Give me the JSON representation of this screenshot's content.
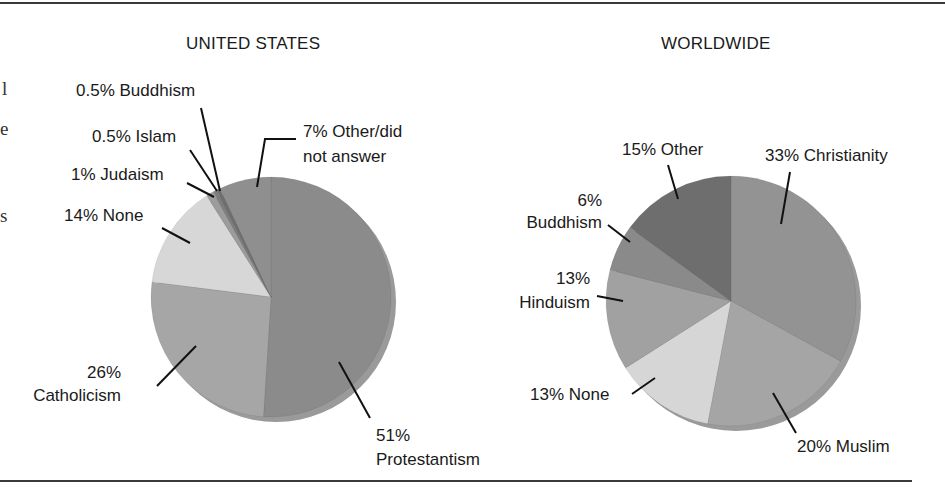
{
  "margin_text": {
    "letters": [
      {
        "char": "l",
        "x": 2,
        "y": 55
      },
      {
        "char": "e",
        "x": 0,
        "y": 117
      },
      {
        "char": "s",
        "x": 0,
        "y": 203
      }
    ]
  },
  "colors": {
    "rule": "#3a3a3a",
    "leader": "#111111",
    "rim": "#9a9a9a"
  },
  "chart_data": [
    {
      "type": "pie",
      "title": "UNITED STATES",
      "center": [
        271,
        297
      ],
      "radius": 120,
      "start_angle_deg": 0,
      "direction": "clockwise",
      "slices": [
        {
          "name": "Protestantism",
          "value": 51,
          "label": "51%\nProtestantism",
          "color": "#8b8b8b"
        },
        {
          "name": "Catholicism",
          "value": 26,
          "label": "26%\nCatholicism",
          "color": "#a6a6a6"
        },
        {
          "name": "None",
          "value": 14,
          "label": "14% None",
          "color": "#d7d7d7"
        },
        {
          "name": "Judaism",
          "value": 1,
          "label": "1% Judaism",
          "color": "#9c9c9c"
        },
        {
          "name": "Islam",
          "value": 0.5,
          "label": "0.5% Islam",
          "color": "#7e7e7e"
        },
        {
          "name": "Buddhism",
          "value": 0.5,
          "label": "0.5% Buddhism",
          "color": "#6f6f6f"
        },
        {
          "name": "Other/did not answer",
          "value": 7,
          "label": "7% Other/did\nnot answer",
          "color": "#8f8f8f"
        }
      ]
    },
    {
      "type": "pie",
      "title": "WORLDWIDE",
      "center": [
        731,
        301
      ],
      "radius": 125,
      "start_angle_deg": 0,
      "direction": "clockwise",
      "slices": [
        {
          "name": "Christianity",
          "value": 33,
          "label": "33% Christianity",
          "color": "#939393"
        },
        {
          "name": "Muslim",
          "value": 20,
          "label": "20% Muslim",
          "color": "#a5a5a5"
        },
        {
          "name": "None",
          "value": 13,
          "label": "13% None",
          "color": "#d6d6d6"
        },
        {
          "name": "Hinduism",
          "value": 13,
          "label": "13%\nHinduism",
          "color": "#a1a1a1"
        },
        {
          "name": "Buddhism",
          "value": 6,
          "label": "6%\nBuddhism",
          "color": "#8a8a8a"
        },
        {
          "name": "Other",
          "value": 15,
          "label": "15% Other",
          "color": "#6e6e6e"
        }
      ]
    }
  ],
  "us": {
    "title": "UNITED STATES",
    "labels": {
      "buddhism": "0.5% Buddhism",
      "islam": "0.5% Islam",
      "judaism": "1% Judaism",
      "none": "14% None",
      "other_line1": "7% Other/did",
      "other_line2": "not answer",
      "catholicism_pct": "26%",
      "catholicism_name": "Catholicism",
      "protestantism_pct": "51%",
      "protestantism_name": "Protestantism"
    }
  },
  "world": {
    "title": "WORLDWIDE",
    "labels": {
      "other": "15% Other",
      "christianity": "33% Christianity",
      "buddhism_pct": "6%",
      "buddhism_name": "Buddhism",
      "hinduism_pct": "13%",
      "hinduism_name": "Hinduism",
      "none": "13% None",
      "muslim": "20% Muslim"
    }
  }
}
